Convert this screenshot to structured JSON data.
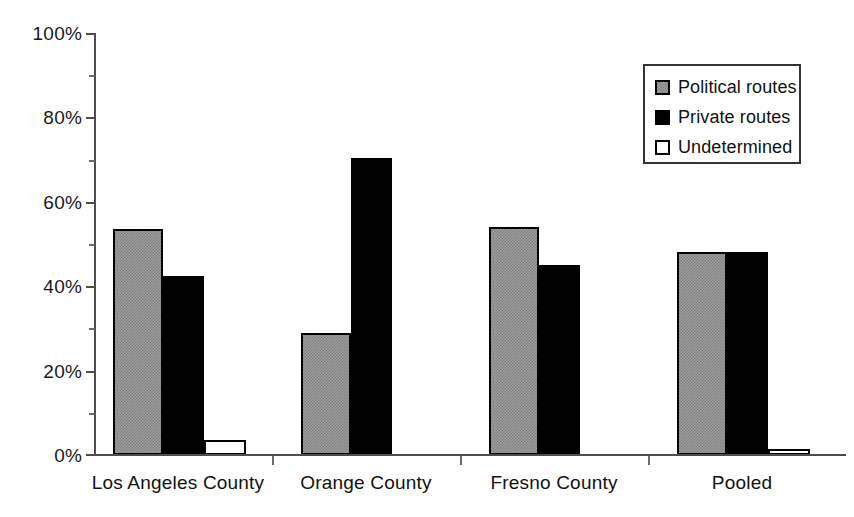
{
  "chart_data": {
    "type": "bar",
    "title": "",
    "subtitle": "",
    "xlabel": "",
    "ylabel": "",
    "ylim": [
      0,
      100
    ],
    "y_tick_labels": [
      "0%",
      "20%",
      "40%",
      "60%",
      "80%",
      "100%"
    ],
    "y_tick_values": [
      0,
      20,
      40,
      60,
      80,
      100
    ],
    "y_minor_tick_values": [
      10,
      30,
      50,
      70,
      90
    ],
    "grid": false,
    "legend_position": "top-right",
    "categories": [
      "Los Angeles County",
      "Orange County",
      "Fresno County",
      "Pooled"
    ],
    "series": [
      {
        "name": "Political routes",
        "color": "#9d9d9d",
        "fill": "checkerboard-gray",
        "values": [
          53.5,
          29.0,
          54.0,
          48.0
        ]
      },
      {
        "name": "Private routes",
        "color": "#000000",
        "fill": "solid-black",
        "values": [
          42.5,
          70.5,
          45.0,
          48.0
        ]
      },
      {
        "name": "Undetermined",
        "color": "#ffffff",
        "fill": "solid-white",
        "values": [
          3.5,
          0.0,
          0.0,
          1.5
        ]
      }
    ]
  },
  "axis": {
    "line_color": "#4d4d4d",
    "tick_color": "#6a6a6a"
  },
  "legend": {
    "items": [
      {
        "label": "Political routes",
        "swatch": "political"
      },
      {
        "label": "Private routes",
        "swatch": "private"
      },
      {
        "label": "Undetermined",
        "swatch": "undetermined"
      }
    ],
    "border_color": "#333333"
  }
}
